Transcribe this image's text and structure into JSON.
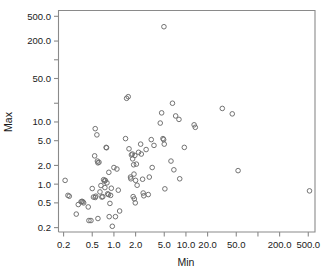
{
  "chart_data": {
    "type": "scatter",
    "title": "",
    "xlabel": "Min",
    "ylabel": "Max",
    "xscale": "log",
    "yscale": "log",
    "grid": false,
    "legend": null,
    "xlim": [
      0.17,
      620
    ],
    "ylim": [
      0.17,
      620
    ],
    "xticks": [
      {
        "value": 0.2,
        "label": "0.2",
        "labeled": true
      },
      {
        "value": 0.5,
        "label": "0.5",
        "labeled": true
      },
      {
        "value": 1.0,
        "label": "1.0",
        "labeled": true
      },
      {
        "value": 2.0,
        "label": "2.0",
        "labeled": true
      },
      {
        "value": 5.0,
        "label": "5.0",
        "labeled": true
      },
      {
        "value": 10.0,
        "label": "10.0",
        "labeled": true
      },
      {
        "value": 20.0,
        "label": "20.0",
        "labeled": true
      },
      {
        "value": 50.0,
        "label": "50.0",
        "labeled": true
      },
      {
        "value": 100.0,
        "label": "",
        "labeled": false
      },
      {
        "value": 200.0,
        "label": "200.0",
        "labeled": true
      },
      {
        "value": 500.0,
        "label": "500.0",
        "labeled": true
      }
    ],
    "yticks": [
      {
        "value": 0.2,
        "label": "0.2",
        "labeled": true
      },
      {
        "value": 0.5,
        "label": "0.5",
        "labeled": true
      },
      {
        "value": 1.0,
        "label": "1.0",
        "labeled": true
      },
      {
        "value": 2.0,
        "label": "2.0",
        "labeled": true
      },
      {
        "value": 5.0,
        "label": "5.0",
        "labeled": true
      },
      {
        "value": 10.0,
        "label": "10.0",
        "labeled": true
      },
      {
        "value": 20.0,
        "label": "",
        "labeled": false
      },
      {
        "value": 50.0,
        "label": "50.0",
        "labeled": true
      },
      {
        "value": 100.0,
        "label": "",
        "labeled": false
      },
      {
        "value": 200.0,
        "label": "200.0",
        "labeled": true
      },
      {
        "value": 500.0,
        "label": "500.0",
        "labeled": true
      }
    ],
    "marker": {
      "shape": "open-circle",
      "radius_px": 2.3,
      "color": "#6b6b6b"
    },
    "points": [
      [
        0.21,
        1.15
      ],
      [
        0.23,
        0.66
      ],
      [
        0.24,
        0.64
      ],
      [
        0.3,
        0.33
      ],
      [
        0.32,
        0.47
      ],
      [
        0.35,
        0.52
      ],
      [
        0.36,
        0.53
      ],
      [
        0.37,
        0.52
      ],
      [
        0.38,
        0.5
      ],
      [
        0.44,
        0.43
      ],
      [
        0.45,
        0.26
      ],
      [
        0.48,
        0.26
      ],
      [
        0.5,
        0.85
      ],
      [
        0.52,
        0.62
      ],
      [
        0.54,
        2.85
      ],
      [
        0.55,
        0.61
      ],
      [
        0.55,
        7.8
      ],
      [
        0.56,
        0.64
      ],
      [
        0.58,
        6.2
      ],
      [
        0.59,
        2.35
      ],
      [
        0.6,
        2.2
      ],
      [
        0.6,
        0.28
      ],
      [
        0.62,
        2.25
      ],
      [
        0.64,
        0.75
      ],
      [
        0.66,
        0.95
      ],
      [
        0.68,
        0.62
      ],
      [
        0.7,
        0.63
      ],
      [
        0.72,
        1.18
      ],
      [
        0.74,
        1.12
      ],
      [
        0.75,
        0.88
      ],
      [
        0.76,
        1.15
      ],
      [
        0.78,
        3.9
      ],
      [
        0.79,
        3.85
      ],
      [
        0.8,
        1.05
      ],
      [
        0.82,
        0.7
      ],
      [
        0.84,
        0.68
      ],
      [
        0.85,
        1.55
      ],
      [
        0.86,
        0.3
      ],
      [
        0.88,
        0.49
      ],
      [
        0.9,
        0.66
      ],
      [
        0.92,
        0.86
      ],
      [
        0.95,
        0.21
      ],
      [
        1.0,
        1.85
      ],
      [
        1.05,
        0.3
      ],
      [
        1.1,
        1.75
      ],
      [
        1.15,
        0.8
      ],
      [
        1.2,
        0.37
      ],
      [
        1.45,
        5.4
      ],
      [
        1.5,
        24.0
      ],
      [
        1.58,
        25.5
      ],
      [
        1.62,
        3.7
      ],
      [
        1.7,
        1.3
      ],
      [
        1.72,
        1.22
      ],
      [
        1.75,
        2.95
      ],
      [
        1.8,
        3.05
      ],
      [
        1.82,
        2.55
      ],
      [
        1.85,
        0.63
      ],
      [
        1.88,
        2.05
      ],
      [
        1.9,
        1.45
      ],
      [
        1.92,
        0.58
      ],
      [
        1.95,
        2.9
      ],
      [
        1.98,
        0.5
      ],
      [
        2.0,
        1.15
      ],
      [
        2.05,
        2.1
      ],
      [
        2.1,
        0.96
      ],
      [
        2.2,
        3.25
      ],
      [
        2.35,
        4.4
      ],
      [
        2.4,
        3.05
      ],
      [
        2.5,
        1.2
      ],
      [
        2.55,
        0.72
      ],
      [
        2.6,
        0.65
      ],
      [
        2.8,
        3.6
      ],
      [
        3.0,
        0.68
      ],
      [
        3.1,
        1.3
      ],
      [
        3.3,
        5.2
      ],
      [
        3.4,
        1.85
      ],
      [
        3.6,
        4.2
      ],
      [
        4.4,
        9.6
      ],
      [
        4.6,
        14.0
      ],
      [
        4.8,
        5.4
      ],
      [
        4.9,
        5.2
      ],
      [
        4.95,
        340.0
      ],
      [
        5.0,
        4.4
      ],
      [
        5.1,
        0.84
      ],
      [
        6.2,
        2.35
      ],
      [
        6.5,
        20.0
      ],
      [
        6.8,
        1.7
      ],
      [
        7.2,
        12.5
      ],
      [
        8.0,
        11.0
      ],
      [
        8.2,
        1.22
      ],
      [
        9.5,
        3.9
      ],
      [
        13.0,
        9.0
      ],
      [
        13.5,
        8.2
      ],
      [
        32.0,
        16.5
      ],
      [
        44.0,
        13.5
      ],
      [
        53.0,
        1.65
      ],
      [
        520.0,
        0.78
      ]
    ]
  },
  "axes": {
    "x_title": "Min",
    "y_title": "Max"
  }
}
